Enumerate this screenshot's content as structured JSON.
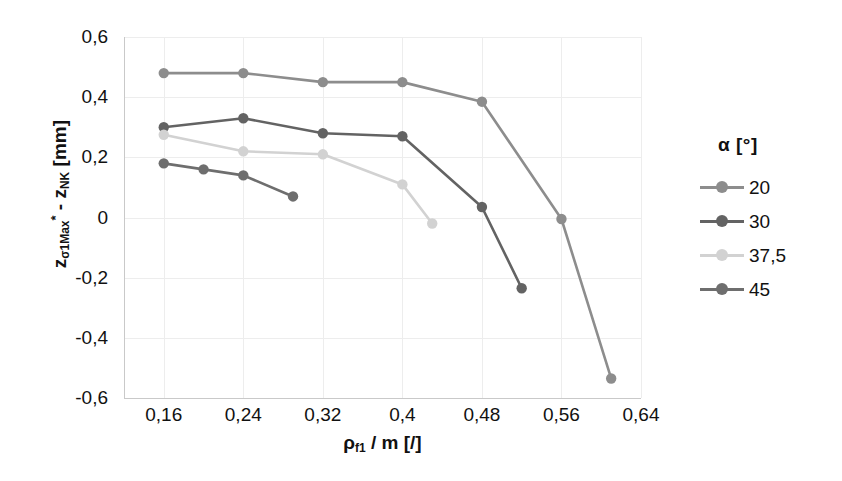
{
  "chart_data": {
    "type": "line",
    "title": "",
    "xlabel": "ρf1 / m [/]",
    "ylabel": "zσ1Max* - zNK [mm]",
    "xlabel_parts": {
      "base1": "ρ",
      "sub1": "f1",
      "mid": " / m [/]"
    },
    "ylabel_parts": {
      "z1": "z",
      "sub1": "σ1Max",
      "star": "*",
      "dash": " - ",
      "z2": "z",
      "sub2": "NK",
      "unit": " [mm]"
    },
    "legend_title": "α [°]",
    "legend_position": "right",
    "grid": true,
    "xlim": [
      0.12,
      0.64
    ],
    "ylim": [
      -0.6,
      0.6
    ],
    "xticks": [
      "0,16",
      "0,24",
      "0,32",
      "0,4",
      "0,48",
      "0,56",
      "0,64"
    ],
    "xtick_values": [
      0.16,
      0.24,
      0.32,
      0.4,
      0.48,
      0.56,
      0.64
    ],
    "yticks": [
      "0,6",
      "0,4",
      "0,2",
      "0",
      "-0,2",
      "-0,4",
      "-0,6"
    ],
    "ytick_values": [
      0.6,
      0.4,
      0.2,
      0,
      -0.2,
      -0.4,
      -0.6
    ],
    "series": [
      {
        "name": "20",
        "color": "#8d8d8d",
        "x": [
          0.16,
          0.24,
          0.32,
          0.4,
          0.48,
          0.56,
          0.61
        ],
        "values": [
          0.48,
          0.48,
          0.45,
          0.45,
          0.385,
          -0.005,
          -0.535
        ]
      },
      {
        "name": "30",
        "color": "#636363",
        "x": [
          0.16,
          0.24,
          0.32,
          0.4,
          0.48,
          0.52
        ],
        "values": [
          0.3,
          0.33,
          0.28,
          0.27,
          0.035,
          -0.235
        ]
      },
      {
        "name": "37,5",
        "color": "#d2d2d2",
        "x": [
          0.16,
          0.24,
          0.32,
          0.4,
          0.43
        ],
        "values": [
          0.275,
          0.22,
          0.21,
          0.11,
          -0.02
        ]
      },
      {
        "name": "45",
        "color": "#6e6e6e",
        "x": [
          0.16,
          0.2,
          0.24,
          0.29
        ],
        "values": [
          0.18,
          0.16,
          0.14,
          0.07
        ]
      }
    ]
  }
}
